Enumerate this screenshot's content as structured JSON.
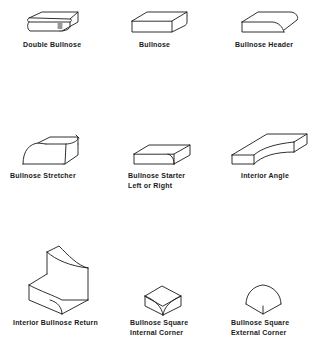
{
  "diagram": {
    "title": "",
    "line_color": "#1a1a1a",
    "background": "#ffffff",
    "items": [
      {
        "id": "double-bullnose",
        "lines": [
          "Double Bullnose"
        ]
      },
      {
        "id": "bullnose",
        "lines": [
          "Bullnose"
        ]
      },
      {
        "id": "bullnose-header",
        "lines": [
          "Bullnose Header"
        ]
      },
      {
        "id": "bullnose-stretcher",
        "lines": [
          "Bullnose Stretcher"
        ]
      },
      {
        "id": "bullnose-starter",
        "lines": [
          "Bullnose Starter",
          "Left or Right"
        ]
      },
      {
        "id": "interior-angle",
        "lines": [
          "Interior Angle"
        ]
      },
      {
        "id": "interior-bullnose-return",
        "lines": [
          "Interior Bullnose Return"
        ]
      },
      {
        "id": "bullnose-square-internal-corner",
        "lines": [
          "Bullnose Square",
          "Internal Corner"
        ]
      },
      {
        "id": "bullnose-square-external-corner",
        "lines": [
          "Bullnose Square",
          "External Corner"
        ]
      }
    ]
  }
}
